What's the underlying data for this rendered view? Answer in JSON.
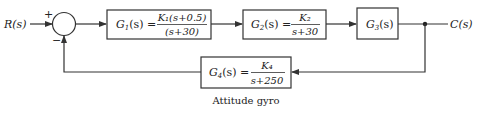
{
  "diagram": {
    "input_label": "R(s)",
    "output_label": "C(s)",
    "summing_junction": {
      "plus_sign": "+",
      "minus_sign": "−"
    },
    "blocks": [
      {
        "name": "G1",
        "lhs": "G",
        "sub": "1",
        "arg": "(s) =",
        "num": "K₁(s+0.5)",
        "den": "(s+30)"
      },
      {
        "name": "G2",
        "lhs": "G",
        "sub": "2",
        "arg": "(s) =",
        "num": "K₂",
        "den": "s+30"
      },
      {
        "name": "G3",
        "lhs": "G",
        "sub": "3",
        "arg": "(s)"
      },
      {
        "name": "G4",
        "lhs": "G",
        "sub": "4",
        "arg": "(s) =",
        "num": "K₄",
        "den": "s+250"
      }
    ],
    "feedback_caption": "Attitude gyro"
  }
}
